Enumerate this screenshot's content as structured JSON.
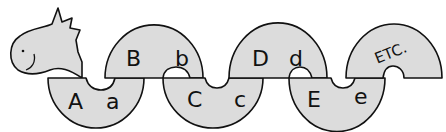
{
  "illustration": {
    "subject": "alphabet snake / dragon",
    "fill_color": "#dcdcdc",
    "outline_color": "#111111",
    "background": "#ffffff",
    "segments": [
      {
        "position": "lower",
        "upper_letter": "A",
        "lower_letter": "a"
      },
      {
        "position": "upper",
        "upper_letter": "B",
        "lower_letter": "b"
      },
      {
        "position": "lower",
        "upper_letter": "C",
        "lower_letter": "c"
      },
      {
        "position": "upper",
        "upper_letter": "D",
        "lower_letter": "d"
      },
      {
        "position": "lower",
        "upper_letter": "E",
        "lower_letter": "e"
      },
      {
        "position": "upper",
        "label": "ETC."
      }
    ]
  }
}
